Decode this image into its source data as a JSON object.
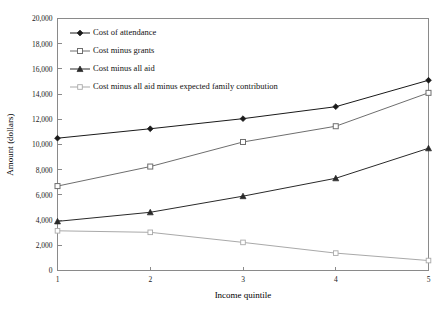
{
  "chart_data": {
    "type": "line",
    "title": "",
    "xlabel": "Income quintile",
    "ylabel": "Amount (dollars)",
    "categories": [
      "1",
      "2",
      "3",
      "4",
      "5"
    ],
    "x": [
      1,
      2,
      3,
      4,
      5
    ],
    "xlim": [
      1,
      5
    ],
    "ylim": [
      0,
      20000
    ],
    "ytick_step": 2000,
    "ytick_labels": [
      "0",
      "2,000",
      "4,000",
      "6,000",
      "8,000",
      "10,000",
      "12,000",
      "14,000",
      "16,000",
      "18,000",
      "20,000"
    ],
    "ytick_values": [
      0,
      2000,
      4000,
      6000,
      8000,
      10000,
      12000,
      14000,
      16000,
      18000,
      20000
    ],
    "xtick_labels": [
      "1",
      "2",
      "3",
      "4",
      "5"
    ],
    "grid": false,
    "legend_position": "upper-left-inside",
    "series": [
      {
        "name": "Cost of attendance",
        "marker": "diamond-filled",
        "color": "#1a1a1a",
        "values": [
          10500,
          11250,
          12050,
          13000,
          15100
        ]
      },
      {
        "name": "Cost minus grants",
        "marker": "square-open",
        "color": "#6e6e6e",
        "values": [
          6700,
          8250,
          10200,
          11450,
          14100
        ]
      },
      {
        "name": "Cost minus all aid",
        "marker": "triangle-filled",
        "color": "#2a2a2a",
        "values": [
          3900,
          4620,
          5900,
          7320,
          9700
        ]
      },
      {
        "name": "Cost minus all aid minus expected family contribution",
        "marker": "square-open-light",
        "color": "#a9a9a9",
        "values": [
          3150,
          3030,
          2230,
          1380,
          790
        ]
      }
    ]
  }
}
